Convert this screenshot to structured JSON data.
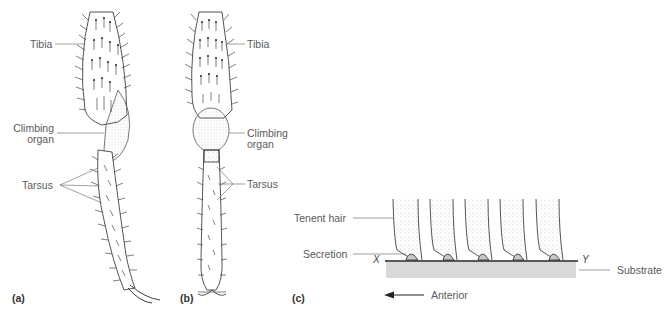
{
  "figure": {
    "panels": [
      {
        "id": "a",
        "label": "(a)",
        "annotations": [
          "Tibia",
          "Climbing organ",
          "Tarsus"
        ]
      },
      {
        "id": "b",
        "label": "(b)",
        "annotations": [
          "Tibia",
          "Climbing organ",
          "Tarsus"
        ]
      },
      {
        "id": "c",
        "label": "(c)",
        "annotations": [
          "Tenent hair",
          "Secretion",
          "Substrate",
          "Anterior"
        ],
        "points": [
          "X",
          "Y"
        ]
      }
    ]
  },
  "a": {
    "tibia": "Tibia",
    "climbing_line1": "Climbing",
    "climbing_line2": "organ",
    "tarsus": "Tarsus",
    "panel": "(a)"
  },
  "b": {
    "tibia": "Tibia",
    "climbing_line1": "Climbing",
    "climbing_line2": "organ",
    "tarsus": "Tarsus",
    "panel": "(b)"
  },
  "c": {
    "tenent_hair": "Tenent hair",
    "secretion": "Secretion",
    "substrate": "Substrate",
    "anterior": "Anterior",
    "x": "X",
    "y": "Y",
    "panel": "(c)"
  },
  "colors": {
    "ink": "#2a2a2a",
    "leader": "#777777",
    "substrate_fill": "#d6d6d6",
    "stipple": "#bdbdbd"
  }
}
